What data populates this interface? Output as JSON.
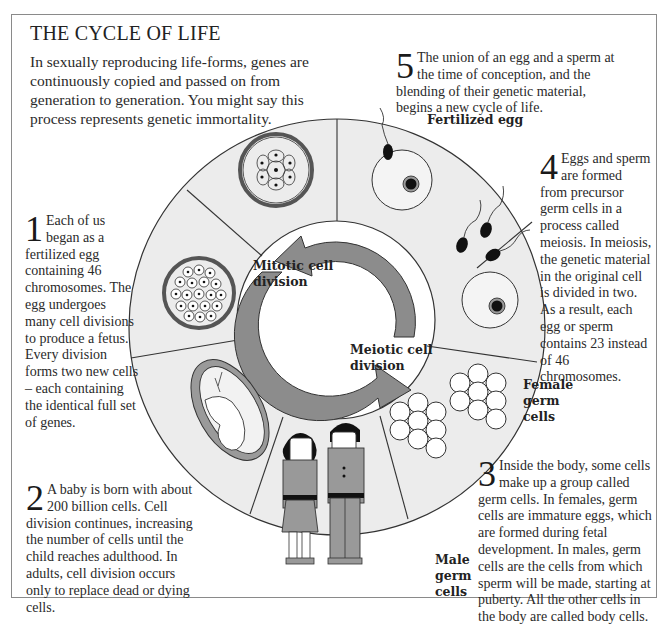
{
  "title": "THE CYCLE OF LIFE",
  "intro": "In sexually reproducing life-forms, genes are continuously copied and passed on from generation to generation. You might say this process represents genetic immortality.",
  "steps": [
    {
      "number": "1",
      "text": "Each of us began as a fertilized egg containing 46 chromosomes. The egg undergoes many cell divisions to produce a fetus. Every division forms two new cells – each containing the identical full set of genes."
    },
    {
      "number": "2",
      "text": "A baby is born with about 200 billion cells. Cell division continues, increasing the number of cells until the child reaches adulthood. In adults, cell division occurs only to replace dead or dying cells."
    },
    {
      "number": "3",
      "text": "Inside the body, some cells make up a group called germ cells. In females, germ cells are immature eggs, which are formed during fetal development. In males, germ cells are the cells from which sperm will be made, starting at puberty. All the other cells in the body are called body cells."
    },
    {
      "number": "4",
      "text": "Eggs and sperm are formed from precursor germ cells in a process called meiosis. In meiosis, the genetic material in the original cell is divided in two. As a result, each egg or sperm contains 23 instead of 46 chromosomes."
    },
    {
      "number": "5",
      "text": "The union of an egg and a sperm at the time of conception, and the blending of their genetic material, begins a new cycle of life."
    }
  ],
  "labels": {
    "fertilized_egg": "Fertilized egg",
    "female_germ_cells": "Female germ cells",
    "male_germ_cells": "Male germ cells",
    "mitotic": "Mitotic cell division",
    "meiotic": "Meiotic cell division"
  },
  "colors": {
    "ring_fill": "#ececec",
    "arrow_fill": "#8c8c8c",
    "outline": "#333333",
    "frame": "#8a8a8a"
  }
}
